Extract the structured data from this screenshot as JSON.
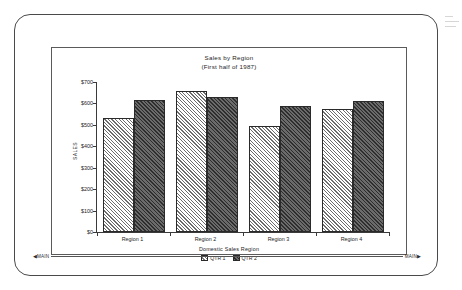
{
  "chart_data": {
    "type": "bar",
    "title": "Sales by Region",
    "subtitle": "(First half of 1987)",
    "xlabel": "Domestic Sales Region",
    "ylabel": "SALES",
    "categories": [
      "Region 1",
      "Region 2",
      "Region 3",
      "Region 4"
    ],
    "series": [
      {
        "name": "QTR 1",
        "values": [
          530,
          660,
          495,
          575
        ]
      },
      {
        "name": "QTR 2",
        "values": [
          615,
          628,
          590,
          612
        ]
      }
    ],
    "ylim": [
      0,
      700
    ],
    "yticks": [
      0,
      100,
      200,
      300,
      400,
      500,
      600,
      700
    ],
    "ytick_labels": [
      "$0",
      "$100",
      "$200",
      "$300",
      "$400",
      "$500",
      "$600",
      "$700"
    ],
    "grid": false,
    "legend_position": "bottom"
  },
  "status_bar": {
    "left_label": "MAIN",
    "right_label": "MAIN"
  }
}
